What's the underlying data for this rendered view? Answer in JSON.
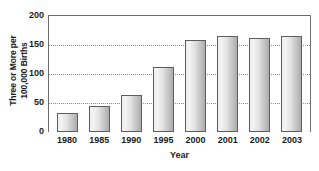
{
  "chart_data": {
    "type": "bar",
    "title": "",
    "xlabel": "Year",
    "ylabel": "Three or More per 100,000 Births",
    "ylabel_line1": "Three or More per",
    "ylabel_line2": "100,000 Births",
    "categories": [
      "1980",
      "1985",
      "1990",
      "1995",
      "2000",
      "2001",
      "2002",
      "2003"
    ],
    "values": [
      33,
      45,
      63,
      112,
      158,
      165,
      162,
      165
    ],
    "ylim": [
      0,
      200
    ],
    "yticks": [
      0,
      50,
      100,
      150,
      200
    ],
    "ytick_labels": [
      "0",
      "50",
      "100",
      "150",
      "200"
    ],
    "grid": true,
    "gridlines_at": [
      50,
      100,
      150
    ],
    "legend": "none",
    "colors": {
      "bar_fill_light": "#f4f4f4",
      "bar_fill_dark": "#aeaeae",
      "bar_border": "#5d5d5d",
      "gridline": "#8a8a8a",
      "axis": "#6e6e6e",
      "text": "#1a1a1a",
      "background": "#ffffff"
    }
  }
}
